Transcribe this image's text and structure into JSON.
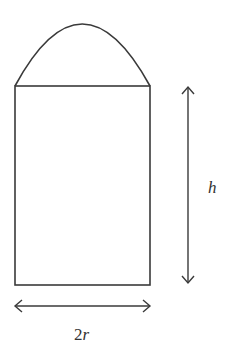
{
  "diagram": {
    "title": "",
    "shapes": [
      {
        "type": "rectangle",
        "name": "cylinder-body"
      },
      {
        "type": "parabolic-arch",
        "name": "dome-top"
      }
    ],
    "labels": {
      "height": "h",
      "width_num": "2",
      "width_var": "r"
    },
    "colors": {
      "stroke": "#3a3a3a",
      "background": "#ffffff"
    }
  }
}
